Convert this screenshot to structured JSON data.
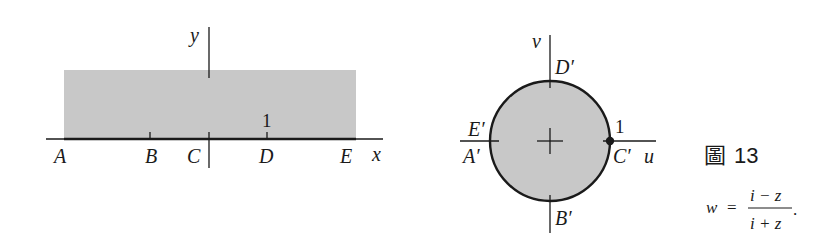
{
  "figure": {
    "caption_prefix": "圖",
    "caption_number": "13",
    "colors": {
      "shade": "#c8c8c8",
      "ink": "#1a1a1a"
    }
  },
  "z_plane": {
    "x_axis_label": "x",
    "y_axis_label": "y",
    "tick_label_1": "1",
    "points": [
      "A",
      "B",
      "C",
      "D",
      "E"
    ]
  },
  "w_plane": {
    "u_axis_label": "u",
    "v_axis_label": "v",
    "tick_label_1": "1",
    "points": [
      "D′",
      "E′",
      "A′",
      "C′",
      "B′"
    ]
  },
  "formula": {
    "lhs": "w",
    "eq": "=",
    "numerator": "i − z",
    "denominator": "i + z",
    "trailing": "."
  }
}
